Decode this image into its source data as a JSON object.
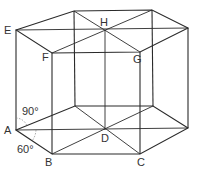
{
  "figure": {
    "type": "hexagonal prism with diagonals",
    "vertex_labels": {
      "E": "E",
      "F": "F",
      "G": "G",
      "H": "H",
      "A": "A",
      "B": "B",
      "C": "C",
      "D": "D"
    },
    "angles": {
      "upper": "90°",
      "lower": "60°"
    }
  }
}
